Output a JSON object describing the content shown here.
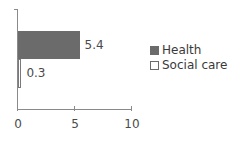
{
  "chart_data": {
    "type": "bar",
    "orientation": "horizontal",
    "title": "",
    "xlabel": "",
    "ylabel": "",
    "xlim": [
      0,
      10
    ],
    "x_ticks": [
      "0",
      "5",
      "10"
    ],
    "grid": false,
    "legend_position": "right",
    "series": [
      {
        "name": "Health",
        "values": [
          5.4
        ],
        "color": "#6b6b6b",
        "label": "5.4"
      },
      {
        "name": "Social care",
        "values": [
          0.3
        ],
        "color": "#ffffff",
        "label": "0.3"
      }
    ]
  },
  "legend": {
    "items": [
      {
        "label": "Health",
        "color": "#6b6b6b"
      },
      {
        "label": "Social care",
        "color": "#ffffff"
      }
    ]
  }
}
